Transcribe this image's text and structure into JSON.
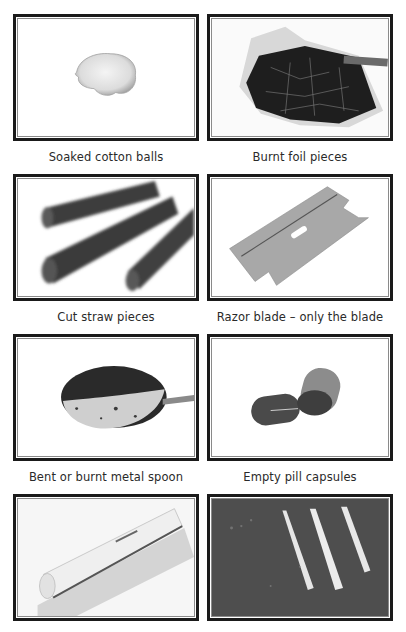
{
  "grid": {
    "items": [
      {
        "caption": "Soaked cotton balls",
        "image": "cotton-ball-photo"
      },
      {
        "caption": "Burnt foil pieces",
        "image": "burnt-foil-photo"
      },
      {
        "caption": "Cut straw pieces",
        "image": "cut-straws-photo"
      },
      {
        "caption": "Razor blade – only the blade",
        "image": "razor-blade-photo"
      },
      {
        "caption": "Bent or burnt metal spoon",
        "image": "burnt-spoon-photo"
      },
      {
        "caption": "Empty pill capsules",
        "image": "pill-capsules-photo"
      },
      {
        "caption": "",
        "image": "rolled-paper-photo"
      },
      {
        "caption": "",
        "image": "powder-lines-photo"
      }
    ]
  }
}
